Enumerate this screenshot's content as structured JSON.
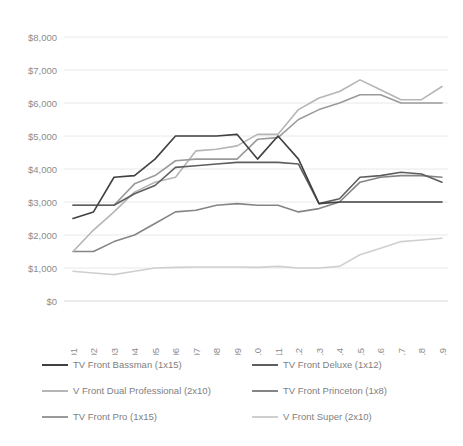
{
  "chart_data": {
    "type": "line",
    "title": "",
    "xlabel": "",
    "ylabel": "",
    "grid": true,
    "legend_position": "bottom",
    "ylim": [
      0,
      8000
    ],
    "ytick_step": 1000,
    "ytick_labels": [
      "$8,000",
      "$7,000",
      "$6,000",
      "$5,000",
      "$4,000",
      "$3,000",
      "$2,000",
      "$1,000",
      "$0"
    ],
    "ytick_values": [
      8000,
      7000,
      6000,
      5000,
      4000,
      3000,
      2000,
      1000,
      0
    ],
    "categories": [
      "2001",
      "2002",
      "2003",
      "2004",
      "2005",
      "2006",
      "2007",
      "2008",
      "2009",
      "2010",
      "2011",
      "2012",
      "2013",
      "2014",
      "2015",
      "2016",
      "2017",
      "2018",
      "2019"
    ],
    "series": [
      {
        "name": "TV Front Bassman (1x15)",
        "color": "#404040",
        "values": [
          2500,
          2700,
          3750,
          3800,
          4300,
          5000,
          5000,
          5000,
          5050,
          4300,
          5000,
          4300,
          2950,
          3000,
          3000,
          3000,
          3000,
          3000,
          3000
        ]
      },
      {
        "name": "TV Front Deluxe (1x12)",
        "color": "#5e5e5e",
        "values": [
          2900,
          2900,
          2900,
          3250,
          3500,
          4050,
          4100,
          4150,
          4200,
          4200,
          4200,
          4150,
          2950,
          3100,
          3750,
          3800,
          3900,
          3850,
          3600
        ]
      },
      {
        "name": "V Front Dual Professional (2x10)",
        "color": "#b5b5b5",
        "values": [
          1500,
          2150,
          2700,
          3300,
          3600,
          3750,
          4550,
          4600,
          4700,
          5050,
          5050,
          5800,
          6150,
          6350,
          6700,
          6400,
          6100,
          6100,
          6500
        ]
      },
      {
        "name": "TV Front Princeton (1x8)",
        "color": "#858585",
        "values": [
          1500,
          1500,
          1800,
          2000,
          2350,
          2700,
          2750,
          2900,
          2950,
          2900,
          2900,
          2700,
          2800,
          3000,
          3600,
          3750,
          3800,
          3800,
          3750
        ]
      },
      {
        "name": "TV Front Pro (1x15)",
        "color": "#9a9a9a",
        "values": [
          2900,
          2900,
          2900,
          3550,
          3800,
          4250,
          4300,
          4300,
          4300,
          4900,
          4950,
          5500,
          5800,
          6000,
          6250,
          6250,
          6000,
          6000,
          6000
        ]
      },
      {
        "name": "V Front Super (2x10)",
        "color": "#cfcfcf",
        "values": [
          900,
          850,
          800,
          900,
          1000,
          1020,
          1030,
          1030,
          1030,
          1020,
          1050,
          1000,
          1000,
          1050,
          1400,
          1600,
          1800,
          1850,
          1900
        ]
      }
    ]
  }
}
